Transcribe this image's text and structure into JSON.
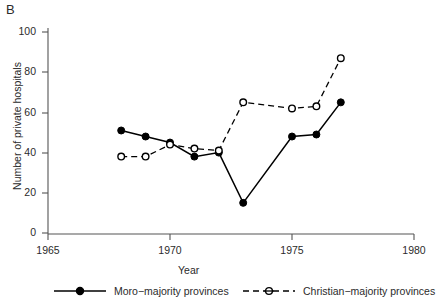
{
  "panel": {
    "label": "B"
  },
  "chart_data": {
    "type": "line",
    "title": "",
    "subtitle": "",
    "xlabel": "Year",
    "ylabel": "Number of private hospitals",
    "xlim": [
      1965,
      1980
    ],
    "ylim": [
      0,
      100
    ],
    "xticks": [
      1965,
      1970,
      1975,
      1980
    ],
    "xtick_labels": [
      "1965",
      "1970",
      "1975",
      "1980"
    ],
    "yticks": [
      0,
      20,
      40,
      60,
      80,
      100
    ],
    "ytick_labels": [
      "0",
      "20",
      "40",
      "60",
      "80",
      "100"
    ],
    "grid": false,
    "legend_position": "below",
    "series": [
      {
        "name": "Moro-majority provinces",
        "style": "solid",
        "marker": "filled-circle",
        "color": "#000000",
        "x": [
          1968,
          1969,
          1970,
          1971,
          1972,
          1973,
          1975,
          1976,
          1977
        ],
        "values": [
          51,
          48,
          45,
          38,
          40,
          15,
          48,
          49,
          65
        ]
      },
      {
        "name": "Christian-majority provinces",
        "style": "dashed",
        "marker": "open-circle",
        "color": "#000000",
        "x": [
          1968,
          1969,
          1970,
          1971,
          1972,
          1973,
          1975,
          1976,
          1977
        ],
        "values": [
          38,
          38,
          44,
          42,
          41,
          65,
          62,
          63,
          87
        ]
      }
    ]
  },
  "axes": {
    "axis_color": "#555555"
  },
  "legend": {
    "items": [
      {
        "label": "Moro−majority provinces",
        "style": "solid",
        "marker": "filled-circle"
      },
      {
        "label": "Christian−majority provinces",
        "style": "dashed",
        "marker": "open-circle"
      }
    ]
  }
}
